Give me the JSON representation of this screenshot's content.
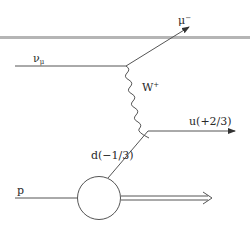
{
  "diagram": {
    "type": "feynman",
    "particles": {
      "incoming_neutrino": {
        "symbol": "ν",
        "subscript": "μ"
      },
      "outgoing_lepton": {
        "symbol": "μ",
        "superscript": "−"
      },
      "boson": {
        "symbol": "W",
        "superscript": "+"
      },
      "outgoing_quark": {
        "label": "u(+2/3)"
      },
      "incoming_quark": {
        "label": "d(−1/3)"
      },
      "proton": {
        "label": "p"
      }
    },
    "colors": {
      "line": "#555555",
      "separator": "#b0b0b0",
      "text": "#2a2a2a",
      "background": "#ffffff"
    }
  }
}
